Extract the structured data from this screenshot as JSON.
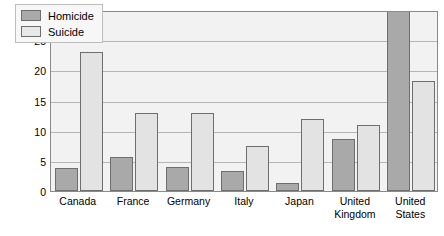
{
  "chart_data": {
    "type": "bar",
    "title": "",
    "xlabel": "",
    "ylabel": "Deaths per 1,000 men aged 15–24",
    "ylim": [
      0,
      30
    ],
    "yticks": [
      0,
      5,
      10,
      15,
      20,
      25,
      30
    ],
    "grid": true,
    "legend_position": "top-left",
    "categories": [
      "Canada",
      "France",
      "Germany",
      "Italy",
      "Japan",
      "United Kingdom",
      "United States"
    ],
    "category_lines": [
      [
        "Canada"
      ],
      [
        "France"
      ],
      [
        "Germany"
      ],
      [
        "Italy"
      ],
      [
        "Japan"
      ],
      [
        "United",
        "Kingdom"
      ],
      [
        "United",
        "States"
      ]
    ],
    "series": [
      {
        "name": "Homicide",
        "color": "#a9a9a9",
        "values": [
          3.8,
          5.7,
          3.9,
          3.3,
          1.4,
          8.7,
          30.0
        ]
      },
      {
        "name": "Suicide",
        "color": "#e3e3e3",
        "values": [
          23.0,
          13.0,
          13.0,
          7.5,
          12.0,
          11.0,
          18.2
        ]
      }
    ]
  },
  "colors": {
    "homicide": "#a9a9a9",
    "suicide": "#e3e3e3",
    "plot_background": "#f2f2f2",
    "gridline": "#b5b5b5",
    "axis": "#8a8a8a",
    "bar_outline": "#6e6e6e"
  }
}
